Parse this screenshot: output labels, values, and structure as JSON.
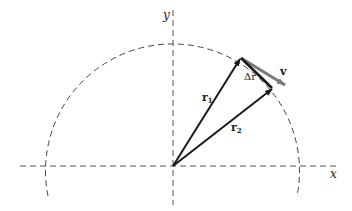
{
  "diagram": {
    "type": "vector-diagram",
    "axes": {
      "x_label": "x",
      "y_label": "y"
    },
    "vectors": {
      "r1": {
        "label": "r",
        "subscript": "1"
      },
      "r2": {
        "label": "r",
        "subscript": "2"
      },
      "delta_r": {
        "label": "Δr"
      },
      "v": {
        "label": "v"
      }
    },
    "colors": {
      "line": "#1a1a1a",
      "velocity": "#7a7a7a",
      "dashed": "#444444",
      "background": "#ffffff"
    }
  }
}
